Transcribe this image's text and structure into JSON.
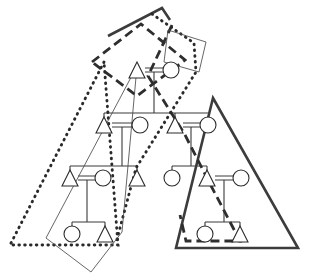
{
  "figure": {
    "background_color": "#ffffff",
    "width": 310,
    "height": 276,
    "symbol_legend": {
      "triangle": "male",
      "circle": "female",
      "double_horizontal_line": "marriage",
      "vertical_and_bracket_lines": "descent"
    }
  },
  "generations": [
    {
      "id": "generation-1",
      "y": 70,
      "persons": [
        {
          "id": "g1-m1",
          "sex": "male",
          "shape": "triangle",
          "x": 137,
          "y": 70
        },
        {
          "id": "g1-f1",
          "sex": "female",
          "shape": "circle",
          "x": 171,
          "y": 70
        }
      ],
      "marriages": [
        {
          "id": "g1-union",
          "left": "g1-m1",
          "right": "g1-f1"
        }
      ]
    },
    {
      "id": "generation-2",
      "y": 125,
      "persons": [
        {
          "id": "g2-m1",
          "sex": "male",
          "shape": "triangle",
          "x": 104,
          "y": 125
        },
        {
          "id": "g2-f1",
          "sex": "female",
          "shape": "circle",
          "x": 140,
          "y": 125
        },
        {
          "id": "g2-m2",
          "sex": "male",
          "shape": "triangle",
          "x": 175,
          "y": 125
        },
        {
          "id": "g2-f2",
          "sex": "female",
          "shape": "circle",
          "x": 208,
          "y": 125
        }
      ],
      "marriages": [
        {
          "id": "g2-union-left",
          "left": "g2-m1",
          "right": "g2-f1"
        },
        {
          "id": "g2-union-right",
          "left": "g2-m2",
          "right": "g2-f2"
        }
      ]
    },
    {
      "id": "generation-3",
      "y": 178,
      "persons": [
        {
          "id": "g3-m1",
          "sex": "male",
          "shape": "triangle",
          "x": 70,
          "y": 178
        },
        {
          "id": "g3-f1",
          "sex": "female",
          "shape": "circle",
          "x": 103,
          "y": 178
        },
        {
          "id": "g3-m2",
          "sex": "male",
          "shape": "triangle",
          "x": 137,
          "y": 178
        },
        {
          "id": "g3-f2",
          "sex": "female",
          "shape": "circle",
          "x": 172,
          "y": 178
        },
        {
          "id": "g3-m3",
          "sex": "male",
          "shape": "triangle",
          "x": 207,
          "y": 178
        },
        {
          "id": "g3-f3",
          "sex": "female",
          "shape": "circle",
          "x": 241,
          "y": 178
        }
      ],
      "marriages": [
        {
          "id": "g3-union-left",
          "left": "g3-m1",
          "right": "g3-f1"
        },
        {
          "id": "g3-union-right",
          "left": "g3-m3",
          "right": "g3-f3"
        }
      ]
    },
    {
      "id": "generation-4",
      "y": 234,
      "persons": [
        {
          "id": "g4-f1",
          "sex": "female",
          "shape": "circle",
          "x": 72,
          "y": 234
        },
        {
          "id": "g4-m1",
          "sex": "male",
          "shape": "triangle",
          "x": 105,
          "y": 234
        },
        {
          "id": "g4-f2",
          "sex": "female",
          "shape": "circle",
          "x": 205,
          "y": 234
        },
        {
          "id": "g4-m2",
          "sex": "male",
          "shape": "triangle",
          "x": 240,
          "y": 234
        }
      ],
      "marriages": []
    }
  ],
  "descent_links": [
    {
      "id": "link-g1-to-g2",
      "from": "g1-union",
      "to": [
        "g2-m1",
        "g2-m2"
      ]
    },
    {
      "id": "link-g2l-to-g3",
      "from": "g2-union-left",
      "to": [
        "g3-m1",
        "g3-m2"
      ]
    },
    {
      "id": "link-g2r-to-g3",
      "from": "g2-union-right",
      "to": [
        "g3-f2",
        "g3-m3"
      ]
    },
    {
      "id": "link-g3l-to-g4",
      "from": "g3-union-left",
      "to": [
        "g4-f1",
        "g4-m1"
      ]
    },
    {
      "id": "link-g3r-to-g4",
      "from": "g3-union-right",
      "to": [
        "g4-f2",
        "g4-m2"
      ]
    }
  ],
  "group_boundaries": [
    {
      "id": "group-solid-right",
      "line_style": "solid-thick",
      "color": "#3c3c3c",
      "description": "large right-hand solid triangle enclosing right descent line",
      "points": "213,98 298,248 176,248"
    },
    {
      "id": "group-solid-top",
      "line_style": "solid-thick",
      "color": "#3c3c3c",
      "description": "open solid peak at top of figure",
      "points": "108,36 162,8 170,20"
    },
    {
      "id": "group-dashed-upper-left",
      "line_style": "dashed-thick",
      "color": "#2e2e2e",
      "description": "dashed quadrilateral over first and second generation at upper left",
      "points": "92,62 141,24 185,60 137,96"
    },
    {
      "id": "group-dashed-right-descent",
      "line_style": "dashed-thick",
      "color": "#2e2e2e",
      "description": "dashed band descending right from the top couple to fourth generation",
      "points": "172,25 148,76 184,133 208,180 240,241 186,241 180,215"
    },
    {
      "id": "group-dotted-left-triangle",
      "line_style": "dotted-thick",
      "color": "#2a2a2a",
      "description": "large dotted triangle enclosing left descent line",
      "points": "104,62 10,245 118,245"
    },
    {
      "id": "group-dotted-right-descent",
      "line_style": "dotted-thick",
      "color": "#2a2a2a",
      "description": "dotted band descending from upper right toward lower centre",
      "points": "152,14 194,43 196,72 166,120 136,168 116,243"
    },
    {
      "id": "group-thin-left-quad",
      "line_style": "thin-solid",
      "color": "#4a4a4a",
      "description": "thin quadrilateral over left lower branch",
      "points": "137,66 46,238 91,272 122,232"
    },
    {
      "id": "group-thin-right-quad",
      "line_style": "thin-solid",
      "color": "#4a4a4a",
      "description": "thin quadrilateral over right upper branch",
      "points": "168,30 206,42 199,72 164,62"
    }
  ]
}
